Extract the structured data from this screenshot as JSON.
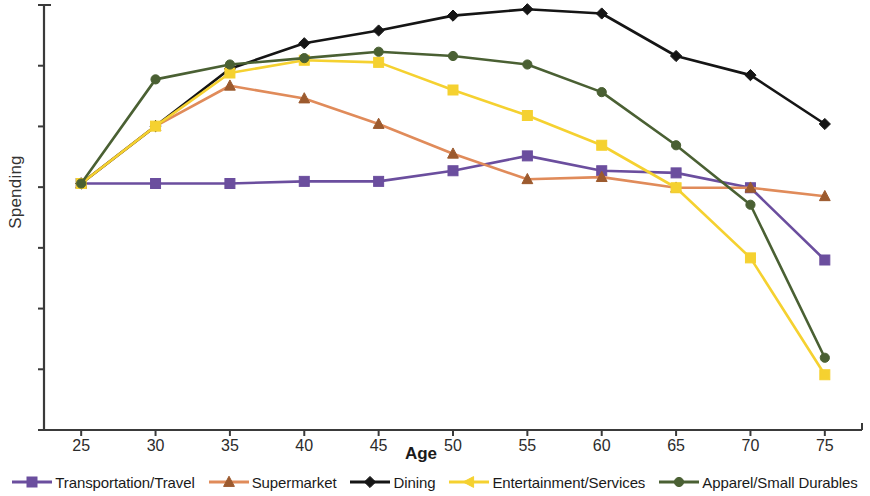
{
  "chart_data": {
    "type": "line",
    "title": "",
    "xlabel": "Age",
    "ylabel": "Spending",
    "x": [
      25,
      30,
      35,
      40,
      45,
      50,
      55,
      60,
      65,
      70,
      75
    ],
    "xtick_labels": [
      "25",
      "30",
      "35",
      "40",
      "45",
      "50",
      "55",
      "60",
      "65",
      "70",
      "75"
    ],
    "xlim": [
      22.5,
      77.5
    ],
    "ylim": [
      0,
      100
    ],
    "ytick_labels": [],
    "y_axis_has_numeric_labels": false,
    "y_tick_count": 8,
    "grid": false,
    "legend_position": "bottom",
    "series": [
      {
        "name": "Transportation/Travel",
        "color": "#6B4E9E",
        "marker": "square",
        "values": [
          58,
          58,
          58,
          58.5,
          58.5,
          61,
          64.5,
          61,
          60.5,
          57,
          40
        ]
      },
      {
        "name": "Supermarket",
        "color": "#E08B5A",
        "marker": "triangle",
        "marker_color": "#9C5A2E",
        "values": [
          58,
          71.5,
          81,
          78,
          72,
          65,
          59,
          59.5,
          57,
          57,
          55
        ]
      },
      {
        "name": "Dining",
        "color": "#151515",
        "marker": "diamond",
        "values": [
          58,
          71.5,
          85,
          91,
          94,
          97.5,
          99,
          98,
          88,
          83.5,
          72
        ]
      },
      {
        "name": "Entertainment/Services",
        "color": "#F5D130",
        "marker": "square",
        "values": [
          58,
          71.5,
          84,
          87,
          86.5,
          80,
          74,
          67,
          57,
          40.5,
          13
        ]
      },
      {
        "name": "Apparel/Small Durables",
        "color": "#4A6033",
        "marker": "circle",
        "values": [
          58,
          82.5,
          86,
          87.5,
          89,
          88,
          86,
          79.5,
          67,
          53,
          17
        ]
      }
    ]
  },
  "axis": {
    "x_title": "Age",
    "y_title": "Spending",
    "color": "#3a3a3a"
  },
  "legend": {
    "items": [
      {
        "label": "Transportation/Travel",
        "color": "#6B4E9E",
        "marker": "square"
      },
      {
        "label": "Supermarket",
        "color": "#E08B5A",
        "marker": "triangle"
      },
      {
        "label": "Dining",
        "color": "#151515",
        "marker": "diamond"
      },
      {
        "label": "Entertainment/Services",
        "color": "#F5D130",
        "marker": "triangle-left"
      },
      {
        "label": "Apparel/Small Durables",
        "color": "#4A6033",
        "marker": "circle"
      }
    ]
  }
}
